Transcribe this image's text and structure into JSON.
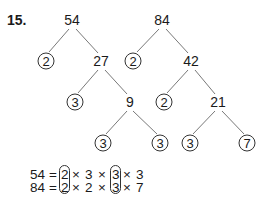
{
  "problem": {
    "label": "15."
  },
  "tree_54": {
    "root": "54",
    "level1": {
      "left": "2",
      "right": "27"
    },
    "level2": {
      "left": "3",
      "right": "9"
    },
    "level3": {
      "left": "3",
      "right": "3"
    }
  },
  "tree_84": {
    "root": "84",
    "level1": {
      "left": "2",
      "right": "42"
    },
    "level2": {
      "left": "2",
      "right": "21"
    },
    "level3": {
      "left": "3",
      "right": "7"
    }
  },
  "equations": [
    {
      "lhs": "54",
      "eq": "=",
      "f1": "2",
      "x1": "×",
      "f2": "3",
      "x2": "×",
      "f3": "3",
      "x3": "×",
      "f4": "3"
    },
    {
      "lhs": "84",
      "eq": "=",
      "f1": "2",
      "x1": "×",
      "f2": "2",
      "x2": "×",
      "f3": "3",
      "x3": "×",
      "f4": "7"
    }
  ],
  "colors": {
    "ink": "#1a1a1a",
    "line": "#555555"
  }
}
